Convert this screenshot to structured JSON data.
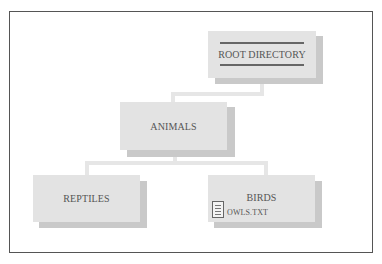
{
  "diagram": {
    "type": "directory-tree",
    "nodes": {
      "root": {
        "label": "ROOT DIRECTORY"
      },
      "animals": {
        "label": "ANIMALS"
      },
      "reptiles": {
        "label": "REPTILES"
      },
      "birds": {
        "label": "BIRDS",
        "files": [
          {
            "name": "OWLS.TXT",
            "icon": "document-icon"
          }
        ]
      }
    },
    "edges": [
      {
        "from": "ROOT DIRECTORY",
        "to": "ANIMALS"
      },
      {
        "from": "ANIMALS",
        "to": "REPTILES"
      },
      {
        "from": "ANIMALS",
        "to": "BIRDS"
      }
    ],
    "colors": {
      "box": "#e3e3e3",
      "shadow": "#c9c9c9",
      "connector": "#e6e6e6",
      "text": "#555555",
      "frame": "#555555"
    }
  }
}
